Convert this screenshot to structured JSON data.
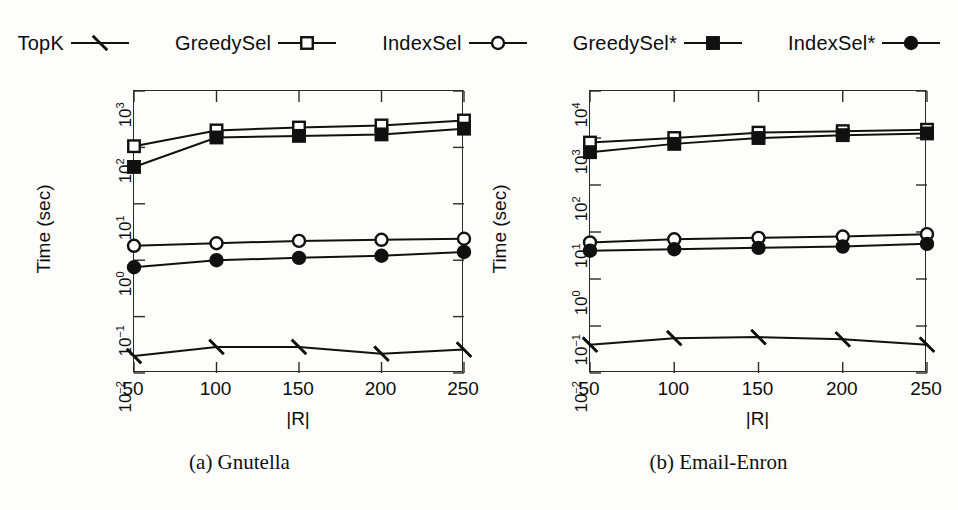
{
  "legend": {
    "entries": [
      {
        "label": "TopK",
        "marker": "cross-marker"
      },
      {
        "label": "GreedySel",
        "marker": "square-open-marker"
      },
      {
        "label": "IndexSel",
        "marker": "circle-open-marker"
      },
      {
        "label": "GreedySel*",
        "marker": "square-filled-marker"
      },
      {
        "label": "IndexSel*",
        "marker": "circle-filled-marker"
      }
    ]
  },
  "colors": {
    "ink": "#111111",
    "frame": "#2a2a2a",
    "paper": "#fdfdfb"
  },
  "panels": [
    {
      "caption": "(a) Gnutella"
    },
    {
      "caption": "(b) Email-Enron"
    }
  ],
  "chart_data": [
    {
      "type": "line",
      "title": "(a) Gnutella",
      "xlabel": "|R|",
      "ylabel": "Time (sec)",
      "xscale": "linear",
      "yscale": "log",
      "categories": [
        50,
        100,
        150,
        200,
        250
      ],
      "xticklabels": [
        "50",
        "100",
        "150",
        "200",
        "250"
      ],
      "yticklabels": [
        "10-2",
        "10-1",
        "100",
        "101",
        "102",
        "103"
      ],
      "ytickvalues": [
        0.01,
        0.1,
        1,
        10,
        100,
        1000
      ],
      "ylim": [
        0.01,
        1000
      ],
      "xlim": [
        50,
        250
      ],
      "grid": false,
      "legend_position": "above-figure",
      "series": [
        {
          "name": "TopK",
          "marker": "cross-marker",
          "values": [
            0.02,
            0.029,
            0.029,
            0.022,
            0.026
          ]
        },
        {
          "name": "GreedySel",
          "marker": "square-open-marker",
          "values": [
            105,
            200,
            225,
            245,
            300
          ]
        },
        {
          "name": "IndexSel",
          "marker": "circle-open-marker",
          "values": [
            1.8,
            2.0,
            2.2,
            2.3,
            2.4
          ]
        },
        {
          "name": "GreedySel*",
          "marker": "square-filled-marker",
          "values": [
            45,
            150,
            160,
            170,
            215
          ]
        },
        {
          "name": "IndexSel*",
          "marker": "circle-filled-marker",
          "values": [
            0.75,
            1.0,
            1.1,
            1.2,
            1.4
          ]
        }
      ]
    },
    {
      "type": "line",
      "title": "(b) Email-Enron",
      "xlabel": "|R|",
      "ylabel": "Time (sec)",
      "xscale": "linear",
      "yscale": "log",
      "categories": [
        50,
        100,
        150,
        200,
        250
      ],
      "xticklabels": [
        "50",
        "100",
        "150",
        "200",
        "250"
      ],
      "yticklabels": [
        "10-2",
        "10-1",
        "100",
        "101",
        "102",
        "103",
        "104"
      ],
      "ytickvalues": [
        0.01,
        0.1,
        1,
        10,
        100,
        1000,
        10000
      ],
      "ylim": [
        0.01,
        10000
      ],
      "xlim": [
        50,
        250
      ],
      "grid": false,
      "legend_position": "above-figure",
      "series": [
        {
          "name": "TopK",
          "marker": "cross-marker",
          "values": [
            0.04,
            0.055,
            0.058,
            0.052,
            0.04
          ]
        },
        {
          "name": "GreedySel",
          "marker": "square-open-marker",
          "values": [
            800,
            1000,
            1300,
            1400,
            1500
          ]
        },
        {
          "name": "IndexSel",
          "marker": "circle-open-marker",
          "values": [
            6.0,
            7.0,
            7.5,
            8.0,
            9.0
          ]
        },
        {
          "name": "GreedySel*",
          "marker": "square-filled-marker",
          "values": [
            500,
            750,
            1000,
            1150,
            1250
          ]
        },
        {
          "name": "IndexSel*",
          "marker": "circle-filled-marker",
          "values": [
            4.0,
            4.3,
            4.6,
            4.9,
            5.6
          ]
        }
      ]
    }
  ]
}
